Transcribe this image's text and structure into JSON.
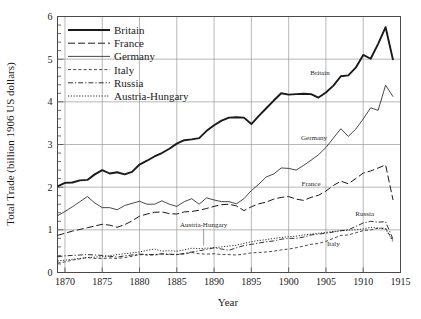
{
  "chart_data": {
    "type": "line",
    "title": "",
    "xlabel": "Year",
    "ylabel": "Total Trade (billion 1906 US dollars)",
    "xlim": [
      1869,
      1915
    ],
    "ylim": [
      0,
      6
    ],
    "xticks": [
      1870,
      1875,
      1880,
      1885,
      1890,
      1895,
      1900,
      1905,
      1910,
      1915
    ],
    "yticks": [
      0,
      1,
      2,
      3,
      4,
      5,
      6
    ],
    "y_minor_step": 0.2,
    "grid": "both-major",
    "legend_position": "top-left-inside",
    "x": [
      1869,
      1870,
      1871,
      1872,
      1873,
      1874,
      1875,
      1876,
      1877,
      1878,
      1879,
      1880,
      1881,
      1882,
      1883,
      1884,
      1885,
      1886,
      1887,
      1888,
      1889,
      1890,
      1891,
      1892,
      1893,
      1894,
      1895,
      1896,
      1897,
      1898,
      1899,
      1900,
      1901,
      1902,
      1903,
      1904,
      1905,
      1906,
      1907,
      1908,
      1909,
      1910,
      1911,
      1912,
      1913,
      1914
    ],
    "series": [
      {
        "name": "Britain",
        "style": "solid-thick",
        "values": [
          2.02,
          2.1,
          2.11,
          2.16,
          2.17,
          2.3,
          2.4,
          2.32,
          2.35,
          2.3,
          2.36,
          2.53,
          2.62,
          2.72,
          2.8,
          2.9,
          3.02,
          3.1,
          3.12,
          3.15,
          3.32,
          3.45,
          3.56,
          3.63,
          3.64,
          3.63,
          3.48,
          3.67,
          3.85,
          4.03,
          4.2,
          4.17,
          4.18,
          4.19,
          4.18,
          4.1,
          4.22,
          4.38,
          4.6,
          4.62,
          4.8,
          5.1,
          5.01,
          5.36,
          5.75,
          4.98
        ]
      },
      {
        "name": "France",
        "style": "long-dash",
        "values": [
          0.87,
          0.92,
          0.97,
          1.01,
          1.05,
          1.09,
          1.13,
          1.11,
          1.06,
          1.12,
          1.21,
          1.32,
          1.37,
          1.41,
          1.42,
          1.38,
          1.37,
          1.42,
          1.43,
          1.46,
          1.5,
          1.55,
          1.59,
          1.6,
          1.56,
          1.45,
          1.54,
          1.61,
          1.65,
          1.72,
          1.76,
          1.78,
          1.72,
          1.69,
          1.76,
          1.81,
          1.91,
          2.04,
          2.14,
          2.08,
          2.2,
          2.33,
          2.38,
          2.45,
          2.52,
          1.7
        ]
      },
      {
        "name": "Germany",
        "style": "solid-thin",
        "values": [
          1.33,
          1.43,
          1.54,
          1.66,
          1.78,
          1.63,
          1.52,
          1.52,
          1.47,
          1.57,
          1.62,
          1.67,
          1.6,
          1.6,
          1.68,
          1.6,
          1.55,
          1.66,
          1.73,
          1.6,
          1.75,
          1.7,
          1.66,
          1.66,
          1.61,
          1.73,
          1.92,
          2.07,
          2.24,
          2.31,
          2.45,
          2.44,
          2.4,
          2.51,
          2.63,
          2.76,
          2.93,
          3.15,
          3.37,
          3.19,
          3.36,
          3.6,
          3.86,
          3.8,
          4.39,
          4.12
        ]
      },
      {
        "name": "Italy",
        "style": "short-dash",
        "values": [
          0.22,
          0.25,
          0.29,
          0.32,
          0.35,
          0.33,
          0.33,
          0.34,
          0.33,
          0.35,
          0.38,
          0.42,
          0.41,
          0.41,
          0.43,
          0.42,
          0.42,
          0.43,
          0.47,
          0.44,
          0.43,
          0.44,
          0.42,
          0.42,
          0.41,
          0.43,
          0.46,
          0.47,
          0.48,
          0.5,
          0.53,
          0.55,
          0.58,
          0.62,
          0.66,
          0.68,
          0.73,
          0.8,
          0.87,
          0.88,
          0.93,
          0.98,
          1.0,
          1.04,
          1.04,
          0.75
        ]
      },
      {
        "name": "Russia",
        "style": "dash-dot",
        "values": [
          0.37,
          0.39,
          0.4,
          0.41,
          0.42,
          0.41,
          0.4,
          0.38,
          0.36,
          0.39,
          0.41,
          0.43,
          0.42,
          0.42,
          0.44,
          0.43,
          0.42,
          0.45,
          0.48,
          0.51,
          0.54,
          0.58,
          0.55,
          0.52,
          0.58,
          0.63,
          0.66,
          0.69,
          0.72,
          0.74,
          0.78,
          0.8,
          0.8,
          0.83,
          0.88,
          0.9,
          0.92,
          0.95,
          0.98,
          1.0,
          1.08,
          1.16,
          1.2,
          1.18,
          1.19,
          0.78
        ]
      },
      {
        "name": "Austria-Hungary",
        "style": "dotted",
        "values": [
          0.27,
          0.29,
          0.31,
          0.33,
          0.35,
          0.36,
          0.37,
          0.39,
          0.42,
          0.44,
          0.46,
          0.48,
          0.52,
          0.55,
          0.5,
          0.51,
          0.5,
          0.53,
          0.57,
          0.56,
          0.57,
          0.58,
          0.6,
          0.62,
          0.64,
          0.68,
          0.72,
          0.75,
          0.77,
          0.8,
          0.82,
          0.84,
          0.85,
          0.88,
          0.9,
          0.92,
          0.94,
          0.96,
          0.98,
          0.99,
          1.0,
          1.02,
          1.06,
          1.04,
          1.02,
          0.72
        ]
      }
    ],
    "legend": [
      {
        "label": "Britain",
        "style": "solid-thick"
      },
      {
        "label": "France",
        "style": "long-dash"
      },
      {
        "label": "Germany",
        "style": "solid-thin"
      },
      {
        "label": "Italy",
        "style": "short-dash"
      },
      {
        "label": "Russia",
        "style": "dash-dot"
      },
      {
        "label": "Austria-Hungary",
        "style": "dotted"
      }
    ],
    "annotations": [
      {
        "text": "Britain",
        "x": 1904.2,
        "y": 4.62
      },
      {
        "text": "Germany",
        "x": 1903.4,
        "y": 3.1
      },
      {
        "text": "France",
        "x": 1903.0,
        "y": 2.03
      },
      {
        "text": "Russia",
        "x": 1910.2,
        "y": 1.33
      },
      {
        "text": "Italy",
        "x": 1906.0,
        "y": 0.63
      },
      {
        "text": "Austria-Hungary",
        "x": 1888.6,
        "y": 1.07
      }
    ]
  }
}
